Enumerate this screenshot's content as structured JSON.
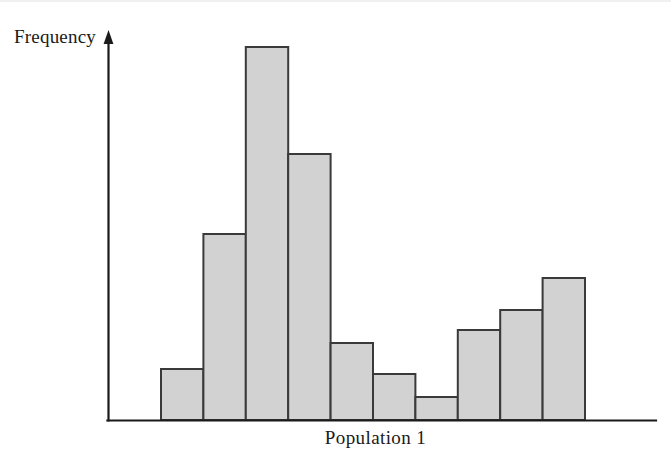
{
  "figure": {
    "background_color": "#ffffff",
    "width": 671,
    "height": 456
  },
  "axes": {
    "y_axis_title": "Frequency",
    "x_axis_title": "Population 1",
    "axis_color": "#1a1a1a",
    "y_axis_has_arrow": true,
    "x_axis_has_arrow": false,
    "tick_labels_shown": false,
    "gridlines": false
  },
  "chart_data": {
    "type": "bar",
    "title": "",
    "subtitle": "",
    "xlabel": "Population 1",
    "ylabel": "Frequency",
    "categories": [
      "1",
      "2",
      "3",
      "4",
      "5",
      "6",
      "7",
      "8",
      "9",
      "10"
    ],
    "values": [
      51,
      186,
      373,
      266,
      77,
      46,
      23,
      90,
      110,
      142
    ],
    "ylim": [
      0,
      388
    ],
    "xlim": [
      0,
      10
    ],
    "bar_fill_color": "#d2d2d2",
    "bar_edge_color": "#3a3a3a",
    "bar_edge_width": 2,
    "bar_gap": 0,
    "legend": null,
    "legend_position": "none",
    "grid": false,
    "axis_ticks": false,
    "annotations": []
  }
}
